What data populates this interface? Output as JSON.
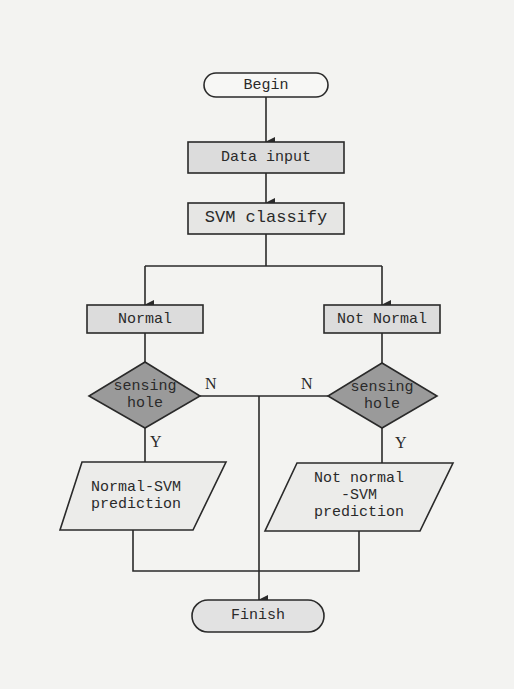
{
  "colors": {
    "background": "#f3f3f1",
    "box_fill": "#dcdcdc",
    "diamond_fill": "#9a9a9a",
    "terminal_fill": "#f7f7f5",
    "finish_fill": "#e2e2e2",
    "stroke": "#2a2a2a"
  },
  "nodes": {
    "begin": "Begin",
    "data_input": "Data input",
    "svm_classify": "SVM classify",
    "normal": "Normal",
    "not_normal": "Not Normal",
    "sensing_left": "sensing\nhole",
    "sensing_right": "sensing\nhole",
    "normal_svm": "Normal-SVM\nprediction",
    "not_normal_svm": "Not normal\n-SVM\nprediction",
    "finish": "Finish"
  },
  "edge_labels": {
    "left_no": "N",
    "right_no": "N",
    "left_yes": "Y",
    "right_yes": "Y"
  }
}
